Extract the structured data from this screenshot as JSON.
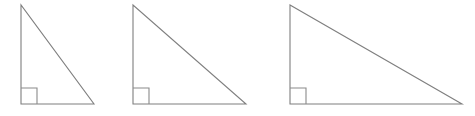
{
  "figure": {
    "background_color": "#ffffff",
    "stroke_color": "#7f7f7f",
    "marker_stroke_color": "#8a8a8a",
    "stroke_width": 1.1,
    "canvas": {
      "width": 475,
      "height": 116
    }
  },
  "chart_data": {
    "type": "diagram",
    "xlabel": "",
    "ylabel": "",
    "units": "pixels",
    "shared": {
      "apex_y": 5,
      "baseline_y": 104,
      "height": 99,
      "right_angle_marker_size": 16
    },
    "shapes": [
      {
        "name": "triangle-1",
        "label": "",
        "vertices": [
          {
            "name": "apex",
            "x": 21,
            "y": 5
          },
          {
            "name": "right-angle",
            "x": 21,
            "y": 104
          },
          {
            "name": "base-right",
            "x": 94,
            "y": 104
          }
        ],
        "base": 73,
        "height": 99,
        "right_angle_marker": {
          "x": 21,
          "y": 88,
          "size": 16
        }
      },
      {
        "name": "triangle-2",
        "label": "",
        "vertices": [
          {
            "name": "apex",
            "x": 133,
            "y": 5
          },
          {
            "name": "right-angle",
            "x": 133,
            "y": 104
          },
          {
            "name": "base-right",
            "x": 246,
            "y": 104
          }
        ],
        "base": 113,
        "height": 99,
        "right_angle_marker": {
          "x": 133,
          "y": 88,
          "size": 16
        }
      },
      {
        "name": "triangle-3",
        "label": "",
        "vertices": [
          {
            "name": "apex",
            "x": 290,
            "y": 5
          },
          {
            "name": "right-angle",
            "x": 290,
            "y": 104
          },
          {
            "name": "base-right",
            "x": 462,
            "y": 104
          }
        ],
        "base": 172,
        "height": 99,
        "right_angle_marker": {
          "x": 290,
          "y": 88,
          "size": 16
        }
      }
    ]
  }
}
